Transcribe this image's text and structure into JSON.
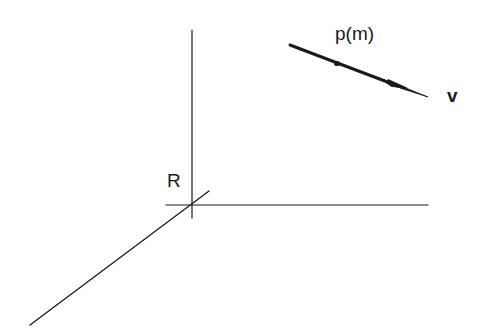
{
  "diagram": {
    "type": "coordinate-frame-with-line",
    "colors": {
      "ink": "#1a1a1a",
      "background": "#ffffff"
    },
    "frame": {
      "origin_label": "R",
      "axes": [
        {
          "name": "vertical-axis",
          "from": [
            192,
            30
          ],
          "to": [
            192,
            218
          ]
        },
        {
          "name": "horizontal-axis",
          "from": [
            166,
            205
          ],
          "to": [
            428,
            205
          ]
        },
        {
          "name": "depth-axis",
          "from": [
            209,
            191
          ],
          "to": [
            30,
            325
          ]
        }
      ]
    },
    "line": {
      "point_label": "p(m)",
      "direction_label": "v",
      "from": [
        290,
        45
      ],
      "to": [
        428,
        97
      ],
      "point_marker": [
        337,
        64
      ],
      "arrow_marker": [
        398,
        86
      ]
    }
  }
}
